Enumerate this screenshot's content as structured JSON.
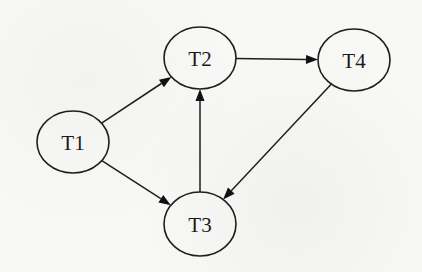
{
  "diagram": {
    "type": "directed-graph",
    "nodes": [
      {
        "id": "T1",
        "label": "T1"
      },
      {
        "id": "T2",
        "label": "T2"
      },
      {
        "id": "T3",
        "label": "T3"
      },
      {
        "id": "T4",
        "label": "T4"
      }
    ],
    "edges": [
      {
        "from": "T1",
        "to": "T2"
      },
      {
        "from": "T1",
        "to": "T3"
      },
      {
        "from": "T3",
        "to": "T2"
      },
      {
        "from": "T2",
        "to": "T4"
      },
      {
        "from": "T4",
        "to": "T3"
      }
    ],
    "colors": {
      "stroke": "#1e1e1e",
      "background": "#f8f8f7"
    }
  }
}
